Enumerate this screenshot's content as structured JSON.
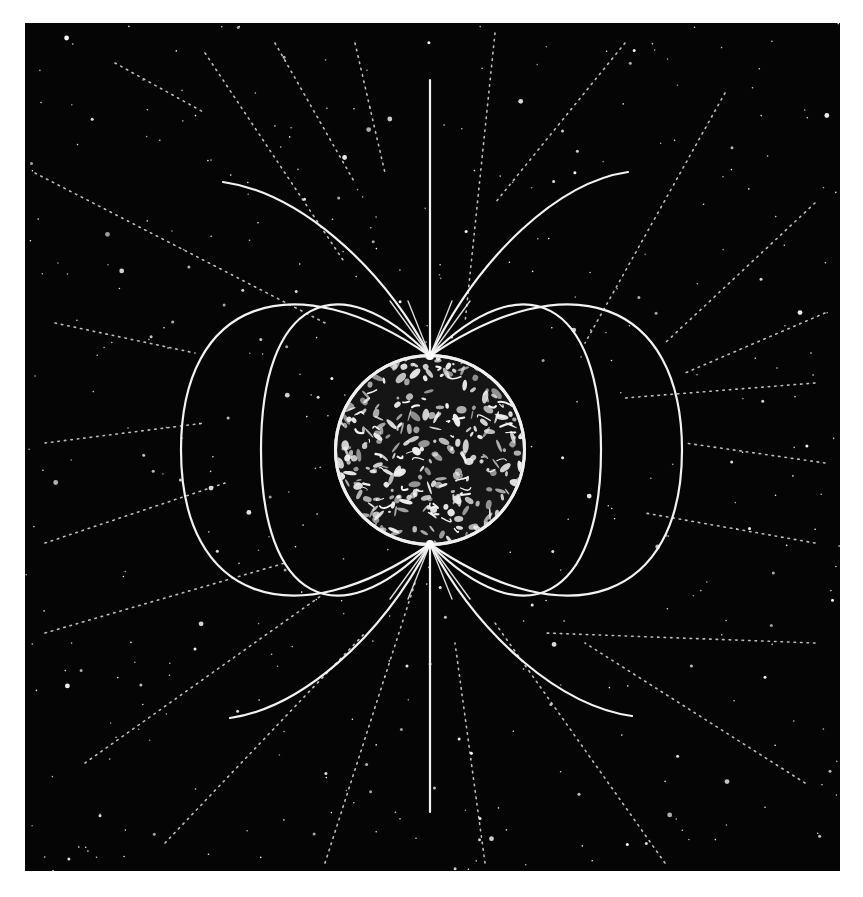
{
  "figure": {
    "colors": {
      "background": "#050505",
      "field_line": "#f2f2f2",
      "star": "#ffffff",
      "page": "#ffffff"
    },
    "earth": {
      "cx": 405,
      "cy": 427,
      "r": 96
    },
    "axis": {
      "x": 405,
      "y_top": 57,
      "y_bottom": 789
    },
    "closed_loops": [
      {
        "name": "inner",
        "left_x": 236,
        "right_x": 576
      },
      {
        "name": "outer",
        "left_x": 156,
        "right_x": 657
      }
    ],
    "open_arcs": [
      {
        "name": "north-left",
        "end": [
          198,
          159
        ]
      },
      {
        "name": "north-right",
        "end": [
          603,
          149
        ]
      },
      {
        "name": "south-left",
        "end": [
          205,
          695
        ]
      },
      {
        "name": "south-right",
        "end": [
          607,
          693
        ]
      }
    ]
  }
}
